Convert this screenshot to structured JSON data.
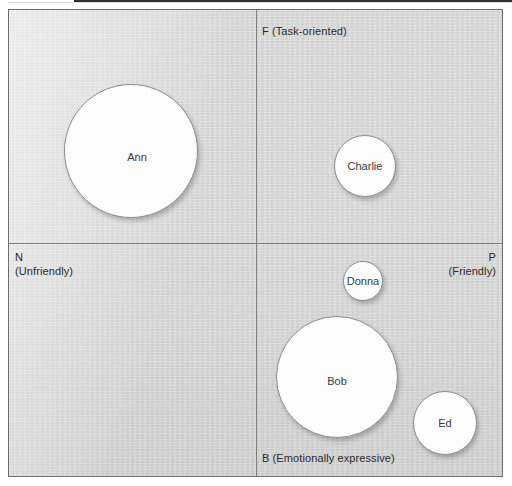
{
  "figure": {
    "background_color": "#ffffff",
    "plot_fill_color": "#d9d9d9",
    "plot_border_color": "#6d6d6d",
    "axis_line_color": "#7e7e7e",
    "bubble_fill_color": "#fdfdfd",
    "bubble_border_color": "#8c8c8c",
    "label_color": "#2b2b2b"
  },
  "axes": {
    "top": {
      "code": "F",
      "descriptor": "(Task-oriented)",
      "full": "F (Task-oriented)"
    },
    "left": {
      "code": "N",
      "descriptor": "(Unfriendly)",
      "full": "N (Unfriendly)"
    },
    "right": {
      "code": "P",
      "descriptor": "(Friendly)",
      "full": "P (Friendly)"
    },
    "bottom": {
      "code": "B",
      "descriptor": "(Emotionally expressive)",
      "full": "B (Emotionally expressive)"
    }
  },
  "bubbles": [
    {
      "label": "Ann",
      "quadrant": "NF",
      "cx": 130,
      "cy": 150,
      "r": 67
    },
    {
      "label": "Charlie",
      "quadrant": "PF",
      "cx": 364,
      "cy": 165,
      "r": 31
    },
    {
      "label": "Donna",
      "quadrant": "PB",
      "cx": 362,
      "cy": 280,
      "r": 20
    },
    {
      "label": "Bob",
      "quadrant": "PB",
      "cx": 336,
      "cy": 376,
      "r": 61
    },
    {
      "label": "Ed",
      "quadrant": "PB",
      "cx": 444,
      "cy": 422,
      "r": 32
    }
  ],
  "chart_data": {
    "type": "scatter",
    "title": "",
    "xlabel": "N (Unfriendly) — P (Friendly)",
    "ylabel": "B (Emotionally expressive) — F (Task-oriented)",
    "grid": false,
    "legend": "none",
    "quadrant_labels": {
      "top": "F (Task-oriented)",
      "left": "N (Unfriendly)",
      "right": "P (Friendly)",
      "bottom": "B (Emotionally expressive)"
    },
    "origin_px": {
      "x": 256,
      "y": 243
    },
    "xlim": [
      0,
      495
    ],
    "ylim": [
      0,
      468
    ],
    "points": [
      {
        "name": "Ann",
        "x": 130,
        "y": 150,
        "size_radius": 67,
        "quadrant": "N-F (Unfriendly / Task-oriented)"
      },
      {
        "name": "Charlie",
        "x": 364,
        "y": 165,
        "size_radius": 31,
        "quadrant": "P-F (Friendly / Task-oriented)"
      },
      {
        "name": "Donna",
        "x": 362,
        "y": 280,
        "size_radius": 20,
        "quadrant": "P-B (Friendly / Emotionally expressive)"
      },
      {
        "name": "Bob",
        "x": 336,
        "y": 376,
        "size_radius": 61,
        "quadrant": "P-B (Friendly / Emotionally expressive)"
      },
      {
        "name": "Ed",
        "x": 444,
        "y": 422,
        "size_radius": 32,
        "quadrant": "P-B (Friendly / Emotionally expressive)"
      }
    ]
  }
}
